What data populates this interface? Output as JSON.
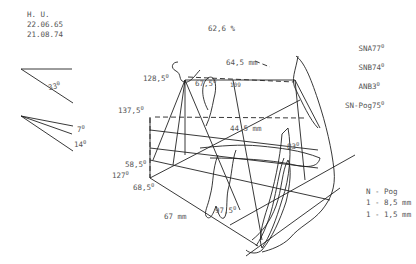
{
  "patient": {
    "initials": "H. U.",
    "birth_date": "22.06.65",
    "exam_date": "21.08.74"
  },
  "title_value": "62,6 %",
  "measurements": [
    {
      "label": "SNA",
      "value": "77",
      "unit": "0"
    },
    {
      "label": "SNB",
      "value": "74",
      "unit": "0"
    },
    {
      "label": "ANB",
      "value": "3",
      "unit": "0"
    },
    {
      "label": "SN-Pog",
      "value": "75",
      "unit": "0"
    }
  ],
  "reference_angles": {
    "top": {
      "value": "33",
      "unit": "0"
    },
    "bottom_a": {
      "value": "7",
      "unit": "0"
    },
    "bottom_b": {
      "value": "14",
      "unit": "0"
    }
  },
  "diagram_labels": {
    "top_distance": "64,5 mm",
    "sella_angle": "128,5",
    "inner_angle": "67,5",
    "small_value": "109",
    "upper_left_angle": "137,5",
    "mid_distance": "44,5 mm",
    "right_angle": "83",
    "lower_left_angle_a": "58,5",
    "lower_left_angle_b": "127",
    "lower_left_angle_c": "68,5",
    "bottom_distance": "67 mm",
    "gonial_angle": "97,5",
    "degree": "0"
  },
  "legend": {
    "title": "N - Pog",
    "line1": "1 - 8,5 mm",
    "line2": "1 - 1,5 mm"
  },
  "colors": {
    "line": "#222222",
    "text": "#555555",
    "background": "#ffffff"
  }
}
